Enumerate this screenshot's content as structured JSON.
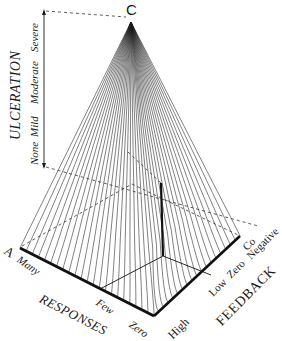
{
  "diagram": {
    "type": "3d-response-surface-pyramid",
    "apex_label": "C",
    "vertical_axis": {
      "title": "ULCERATION",
      "ticks": [
        "None",
        "Mild",
        "Moderate",
        "Severe"
      ]
    },
    "left_axis": {
      "title": "RESPONSES",
      "corner_label": "A",
      "ticks": [
        "Many",
        "Few",
        "Zero"
      ]
    },
    "right_axis": {
      "title": "FEEDBACK",
      "corner_label": "Co",
      "ticks": [
        "High",
        "Low",
        "Zero",
        "Negative"
      ]
    },
    "colors": {
      "lines": "#1a1a1a",
      "background": "#ffffff"
    }
  }
}
